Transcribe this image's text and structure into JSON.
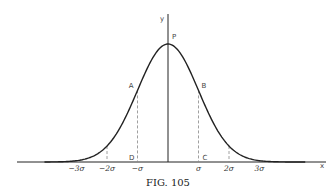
{
  "figure": {
    "caption": "FIG. 105",
    "ink_color": "#222222",
    "dash_color": "#888888"
  },
  "chart_data": {
    "type": "line",
    "title": "",
    "xlabel": "x",
    "ylabel": "y",
    "xlim": [
      -4.3,
      5.1
    ],
    "ylim": [
      0,
      1.25
    ],
    "grid": false,
    "legend": "none",
    "curve": {
      "name": "normal curve",
      "function": "exp(-x^2/2)",
      "x_range": [
        -4.05,
        4.5
      ]
    },
    "ticks": [
      {
        "value": -3,
        "label": "-3σ",
        "dashed_ordinate": true
      },
      {
        "value": -2,
        "label": "-2σ",
        "dashed_ordinate": true
      },
      {
        "value": -1,
        "label": "-σ",
        "dashed_ordinate": true
      },
      {
        "value": 1,
        "label": "σ",
        "dashed_ordinate": true
      },
      {
        "value": 2,
        "label": "2σ",
        "dashed_ordinate": true
      },
      {
        "value": 3,
        "label": "3σ",
        "dashed_ordinate": true
      }
    ],
    "points": [
      {
        "label": "P",
        "x": 0,
        "note": "peak on y-axis"
      },
      {
        "label": "A",
        "x": -1,
        "note": "curve at -σ"
      },
      {
        "label": "B",
        "x": 1,
        "note": "curve at σ"
      },
      {
        "label": "D",
        "x": -1,
        "note": "foot of ordinate at -σ on x-axis"
      },
      {
        "label": "C",
        "x": 1,
        "note": "foot of ordinate at σ on x-axis"
      }
    ]
  }
}
